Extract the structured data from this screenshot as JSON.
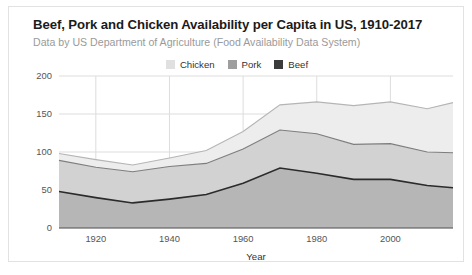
{
  "card": {
    "title": "Beef, Pork and Chicken Availability per Capita in US, 1910-2017",
    "subtitle": "Data by US Department of Agriculture (Food Availability Data System)"
  },
  "legend": {
    "position": "top-center",
    "items": [
      {
        "label": "Chicken",
        "color": "#e0e0e0"
      },
      {
        "label": "Pork",
        "color": "#9e9e9e"
      },
      {
        "label": "Beef",
        "color": "#3b3b3b"
      }
    ]
  },
  "colors": {
    "chicken_fill": "#ededed",
    "chicken_line": "#b5b5b5",
    "pork_fill": "#d2d2d2",
    "pork_line": "#7d7d7d",
    "beef_fill": "#b6b6b6",
    "beef_line": "#2b2b2b",
    "grid": "#dddddd",
    "axis": "#555555",
    "card_border": "#e2e2e2",
    "title_text": "#1b1b1b",
    "subtitle_text": "#9a9a9a"
  },
  "chart_data": {
    "type": "area",
    "stacked": true,
    "title": "Beef, Pork and Chicken Availability per Capita in US, 1910-2017",
    "subtitle": "Data by US Department of Agriculture (Food Availability Data System)",
    "xlabel": "Year",
    "ylabel": "",
    "xlim": [
      1910,
      2017
    ],
    "ylim": [
      0,
      200
    ],
    "grid": true,
    "x": [
      1910,
      1920,
      1930,
      1940,
      1950,
      1960,
      1970,
      1980,
      1990,
      2000,
      2010,
      2017
    ],
    "xticks": [
      1920,
      1940,
      1960,
      1980,
      2000
    ],
    "yticks": [
      0,
      50,
      100,
      150,
      200
    ],
    "series": [
      {
        "name": "Beef",
        "order": 1,
        "color": "#b6b6b6",
        "line": "#2b2b2b",
        "values": [
          48,
          40,
          33,
          38,
          44,
          59,
          79,
          72,
          64,
          64,
          56,
          53
        ]
      },
      {
        "name": "Pork",
        "order": 2,
        "color": "#d2d2d2",
        "line": "#7d7d7d",
        "values": [
          41,
          40,
          41,
          43,
          41,
          45,
          50,
          52,
          46,
          47,
          44,
          46
        ]
      },
      {
        "name": "Chicken",
        "order": 3,
        "color": "#ededed",
        "line": "#b5b5b5",
        "values": [
          9,
          10,
          9,
          11,
          17,
          23,
          33,
          42,
          51,
          55,
          57,
          66
        ]
      }
    ],
    "stack_totals": [
      98,
      90,
      83,
      92,
      102,
      127,
      162,
      166,
      161,
      166,
      157,
      165
    ]
  }
}
